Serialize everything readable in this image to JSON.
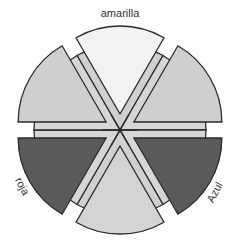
{
  "diagram": {
    "sectors": [
      {
        "id": "top",
        "name": "amarilla",
        "label": "amarilla",
        "outer_fill": "#f2f2f2",
        "inner_fill": "#d0d0d0"
      },
      {
        "id": "top-right",
        "name": "verde-amarilla",
        "label": "",
        "outer_fill": "#cfcfcf",
        "inner_fill": "#d6d6d6"
      },
      {
        "id": "bottom-right",
        "name": "azul",
        "label": "Azul",
        "outer_fill": "#5a5a5a",
        "inner_fill": "#d6d6d6"
      },
      {
        "id": "bottom",
        "name": "violeta",
        "label": "",
        "outer_fill": "#d4d4d4",
        "inner_fill": "#d0d0d0"
      },
      {
        "id": "bottom-left",
        "name": "roja",
        "label": "roja",
        "outer_fill": "#5a5a5a",
        "inner_fill": "#d6d6d6"
      },
      {
        "id": "top-left",
        "name": "naranja",
        "label": "",
        "outer_fill": "#cfcfcf",
        "inner_fill": "#d6d6d6"
      }
    ],
    "labels": {
      "top": "amarilla",
      "bottom_left": "roja",
      "bottom_right": "Azul"
    },
    "colors": {
      "stroke": "#2a2a2a",
      "text": "#333333",
      "background": "#ffffff"
    }
  }
}
